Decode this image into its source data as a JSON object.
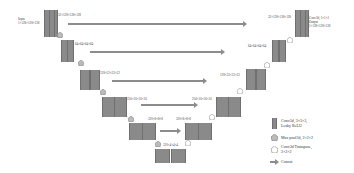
{
  "diagram": {
    "type": "3D U-Net architecture",
    "input": {
      "title": "Input",
      "shape": "1×128×128×128"
    },
    "output": {
      "title": "Output",
      "conv": "Conv3d, 1×1×1",
      "shape": "1×128×128×128"
    },
    "encoder_labels": [
      "32×128×128×128",
      "64×64×64×64",
      "128×32×32×32",
      "256×16×16×16",
      "320×8×8×8",
      "320×4×4×4"
    ],
    "decoder_labels": [
      "32×128×128×128",
      "64×64×64×64",
      "128×32×32×32",
      "256×16×16×16",
      "320×8×8×8"
    ],
    "legend": [
      {
        "icon": "conv-block-icon",
        "text1": "Conv3d, 3×3×3,",
        "text2": "Leaky ReLU"
      },
      {
        "icon": "max-pool-icon",
        "text1": "Max pool3d, 2×2×2",
        "text2": ""
      },
      {
        "icon": "conv-transpose-icon",
        "text1": "Conv3d Transpose,",
        "text2": "2×2×2"
      },
      {
        "icon": "concat-arrow-icon",
        "text1": "Concat",
        "text2": ""
      }
    ],
    "colors": {
      "block": "#8a8a8a",
      "arrow": "#8c8c8c",
      "text": "#444444"
    }
  }
}
